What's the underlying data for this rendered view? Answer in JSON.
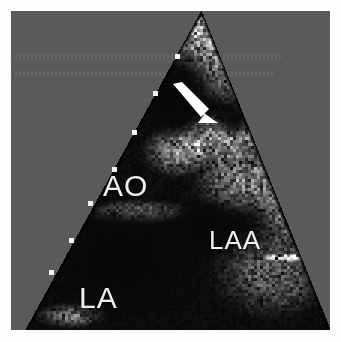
{
  "figure": {
    "modality": "transesophageal-echocardiogram",
    "view": "two-dimensional B-mode sector scan",
    "background_color": "#5a5a5a",
    "border_color": "#fdfdfd",
    "sector": {
      "apex_x": 190,
      "apex_y": 0,
      "left_edge_bottom_x": 14,
      "right_edge_bottom_x": 319,
      "depth_px": 319,
      "fill_color": "#000000"
    }
  },
  "annotations": {
    "labels": [
      {
        "id": "ao",
        "text": "AO",
        "color": "#f0f0f0",
        "x": 92,
        "y": 160
      },
      {
        "id": "laa",
        "text": "LAA",
        "color": "#f0f0f0",
        "x": 198,
        "y": 216
      },
      {
        "id": "la",
        "text": "LA",
        "color": "#f0f0f0",
        "x": 68,
        "y": 272
      }
    ],
    "arrow": {
      "id": "finding-arrow",
      "color": "#ffffff",
      "tail_x": 166,
      "tail_y": 76,
      "tip_x": 206,
      "tip_y": 112,
      "direction": "down-right"
    }
  },
  "depth_markers": {
    "color": "#f2f2f2",
    "size_px": 5,
    "points": [
      {
        "x": 164,
        "y": 43
      },
      {
        "x": 142,
        "y": 80
      },
      {
        "x": 121,
        "y": 119
      },
      {
        "x": 101,
        "y": 156
      },
      {
        "x": 77,
        "y": 190
      },
      {
        "x": 58,
        "y": 227
      },
      {
        "x": 38,
        "y": 259
      }
    ]
  },
  "ghost_rows": [
    {
      "id": "ghost-row-1",
      "x": 4,
      "y": 43,
      "width": 268
    },
    {
      "id": "ghost-row-2",
      "x": 4,
      "y": 60,
      "width": 258
    }
  ],
  "speckle": {
    "seed": 20240517,
    "grain_px": 3,
    "base_level": 8,
    "bright_structures": [
      {
        "cx": 190,
        "cy": 18,
        "rx": 95,
        "ry": 46,
        "gain": 210,
        "name": "near-field-tissue-band"
      },
      {
        "cx": 232,
        "cy": 58,
        "rx": 62,
        "ry": 42,
        "gain": 180,
        "name": "upper-right-tissue"
      },
      {
        "cx": 268,
        "cy": 112,
        "rx": 66,
        "ry": 58,
        "gain": 175,
        "name": "right-lateral-wall"
      },
      {
        "cx": 206,
        "cy": 128,
        "rx": 46,
        "ry": 30,
        "gain": 185,
        "name": "aortic-wall-echo"
      },
      {
        "cx": 166,
        "cy": 140,
        "rx": 40,
        "ry": 30,
        "gain": 165,
        "name": "aortic-root-margin"
      },
      {
        "cx": 232,
        "cy": 168,
        "rx": 58,
        "ry": 40,
        "gain": 160,
        "name": "left-atrial-appendage-wall"
      },
      {
        "cx": 286,
        "cy": 196,
        "rx": 52,
        "ry": 52,
        "gain": 150,
        "name": "lateral-atrial-wall"
      },
      {
        "cx": 126,
        "cy": 200,
        "rx": 58,
        "ry": 14,
        "gain": 150,
        "name": "posterior-aortic-wall"
      },
      {
        "cx": 262,
        "cy": 262,
        "rx": 70,
        "ry": 52,
        "gain": 110,
        "name": "far-field-tissue"
      },
      {
        "cx": 60,
        "cy": 304,
        "rx": 40,
        "ry": 14,
        "gain": 150,
        "name": "far-field-left-margin"
      },
      {
        "cx": 276,
        "cy": 246,
        "rx": 30,
        "ry": 5,
        "gain": 235,
        "name": "specular-reflector-streak"
      }
    ],
    "dark_cavities": [
      {
        "cx": 160,
        "cy": 86,
        "rx": 40,
        "ry": 42,
        "name": "aortic-lumen"
      },
      {
        "cx": 222,
        "cy": 108,
        "rx": 22,
        "ry": 20,
        "name": "central-echo-free-space"
      },
      {
        "cx": 110,
        "cy": 250,
        "rx": 95,
        "ry": 72,
        "name": "left-atrium-cavity"
      },
      {
        "cx": 196,
        "cy": 216,
        "rx": 44,
        "ry": 30,
        "name": "appendage-cavity"
      }
    ]
  }
}
